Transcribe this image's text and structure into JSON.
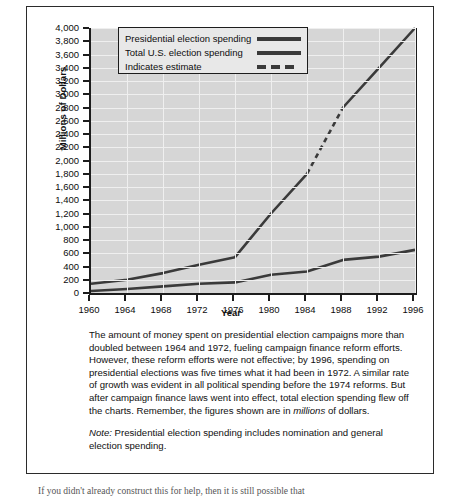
{
  "chart_data": {
    "type": "line",
    "title": "",
    "xlabel": "Year",
    "ylabel": "Millions of Dollars",
    "x": [
      1960,
      1964,
      1968,
      1972,
      1976,
      1980,
      1984,
      1988,
      1992,
      1996
    ],
    "xlim": [
      1960,
      1996
    ],
    "ylim": [
      0,
      4000
    ],
    "ytick_step": 200,
    "grid": true,
    "legend_position": "top-left",
    "xticks": [
      "1960",
      "1964",
      "1968",
      "1972",
      "1976",
      "1980",
      "1984",
      "1988",
      "1992",
      "1996"
    ],
    "yticks": [
      "0",
      "200",
      "400",
      "600",
      "800",
      "1,000",
      "1,200",
      "1,400",
      "1,600",
      "1,800",
      "2,000",
      "2,200",
      "2,400",
      "2,600",
      "2,800",
      "3,000",
      "3,200",
      "3,400",
      "3,600",
      "3,800",
      "4,000"
    ],
    "series": [
      {
        "name": "Total U.S. election spending",
        "values": [
          140,
          200,
          300,
          425,
          540,
          1200,
          1800,
          2800,
          3400,
          4000
        ],
        "estimate_from": 1984,
        "estimate_to": 1988
      },
      {
        "name": "Presidential election spending",
        "values": [
          30,
          60,
          100,
          140,
          160,
          275,
          325,
          500,
          550,
          650
        ]
      }
    ],
    "legend": [
      {
        "label": "Presidential election spending",
        "style": "solid"
      },
      {
        "label": "Total U.S. election spending",
        "style": "solid"
      },
      {
        "label": "Indicates estimate",
        "style": "dashed"
      }
    ],
    "colors": {
      "line": "#3a3a3a",
      "plot_background": "#d6d6d6",
      "grid": "#efefef",
      "axis": "#1c1c1c"
    }
  },
  "caption": {
    "body_1": "The amount of money spent on presidential election campaigns more than doubled between 1964 and 1972, fueling campaign finance reform efforts. However, these reform efforts were not effective; by 1996, spending on presidential elections was five times what it had been in 1972.  A similar rate of growth was evident in all political spending before the 1974 reforms. But after campaign finance laws went into effect, total election spending flew off the charts. Remember, the figures shown are in ",
    "body_1_italic": "millions",
    "body_1_end": " of dollars.",
    "note_label": "Note:",
    "note_text": " Presidential election spending includes nomination and general election spending."
  },
  "page_tail": "If you didn't already construct this for help, then it is still possible that"
}
